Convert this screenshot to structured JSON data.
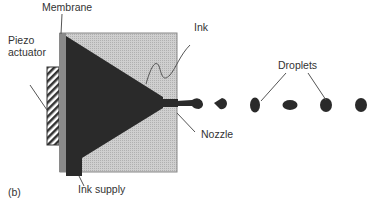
{
  "figure": {
    "panel_label": "(b)",
    "labels": {
      "membrane": "Membrane",
      "piezo": "Piezo",
      "actuator": "actuator",
      "ink": "Ink",
      "droplets": "Droplets",
      "nozzle": "Nozzle",
      "ink_supply": "Ink supply"
    },
    "colors": {
      "housing": "#c8c8c8",
      "ink": "#2a2a2a",
      "membrane": "#8a8a8a",
      "leader": "#555555"
    },
    "droplet_count": 6
  }
}
